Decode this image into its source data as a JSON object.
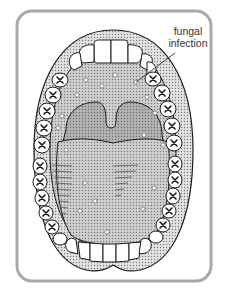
{
  "figure": {
    "annotation": {
      "line1": "fungal",
      "line2": "infection"
    },
    "colors": {
      "frame_border": "#a9a9a9",
      "gum": "#c9c9c9",
      "mouth_floor": "#d4d4d4",
      "palate": "#a8a8a8",
      "tongue": "#bdbdbd",
      "teeth": "#ffffff",
      "outline": "#1a1a1a",
      "spots": "#ffffff"
    }
  }
}
